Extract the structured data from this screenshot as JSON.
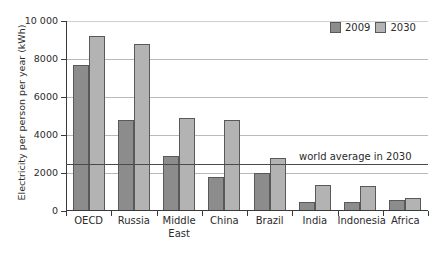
{
  "chart_data": {
    "type": "bar",
    "title": "",
    "xlabel": "",
    "ylabel": "Electricity per person per year (kWh)",
    "categories": [
      "OECD",
      "Russia",
      "Middle\nEast",
      "China",
      "Brazil",
      "India",
      "Indonesia",
      "Africa"
    ],
    "series": [
      {
        "name": "2009",
        "color": "#8c8c8c",
        "values": [
          7700,
          4800,
          2900,
          1800,
          2000,
          450,
          500,
          580
        ]
      },
      {
        "name": "2030",
        "color": "#b3b3b3",
        "values": [
          9200,
          8800,
          4900,
          4800,
          2800,
          1350,
          1300,
          680
        ]
      }
    ],
    "ylim": [
      0,
      10000
    ],
    "ytick_values": [
      10000,
      8000,
      6000,
      4000,
      2000,
      0
    ],
    "ytick_labels": [
      "10 000",
      "8000",
      "6000",
      "4000",
      "2000",
      "0"
    ],
    "grid": true,
    "legend_position": "top-right",
    "annotations": [
      {
        "name": "world-average-line",
        "label": "world average in 2030",
        "value": 2500
      }
    ]
  },
  "legend": {
    "items": [
      {
        "label": "2009",
        "color": "#8c8c8c"
      },
      {
        "label": "2030",
        "color": "#b3b3b3"
      }
    ]
  },
  "axis": {
    "y_title": "Electricity per person per year (kWh)"
  }
}
